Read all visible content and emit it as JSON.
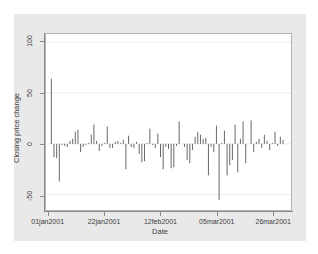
{
  "chart_data": {
    "type": "bar",
    "title": "",
    "subtitle": "",
    "xlabel": "Date",
    "ylabel": "Closing price change",
    "ylim": [
      -65,
      108
    ],
    "yticks": [
      -50,
      0,
      50,
      100
    ],
    "ytick_labels": [
      "-50",
      "0",
      "50",
      "100"
    ],
    "xtick_labels": [
      "01jan2001",
      "22jan2001",
      "12feb2001",
      "05mar2001",
      "26mar2001"
    ],
    "xtick_values": [
      0,
      21,
      42,
      63,
      84
    ],
    "xlim": [
      -1,
      91
    ],
    "grid": "horizontal",
    "legend": "none",
    "style": "spike",
    "series_name": "Closing price change",
    "x": [
      1,
      2,
      3,
      4,
      5,
      6,
      7,
      8,
      9,
      10,
      11,
      12,
      13,
      14,
      15,
      16,
      17,
      18,
      19,
      20,
      21,
      22,
      23,
      24,
      25,
      26,
      27,
      28,
      29,
      30,
      31,
      32,
      33,
      34,
      35,
      36,
      37,
      38,
      39,
      40,
      41,
      42,
      43,
      44,
      45,
      46,
      47,
      48,
      49,
      50,
      51,
      52,
      53,
      54,
      55,
      56,
      57,
      58,
      59,
      60,
      61,
      62,
      63,
      64,
      65,
      66,
      67,
      68,
      69,
      70,
      71,
      72,
      73,
      74,
      75,
      76,
      77,
      78,
      79,
      80,
      81,
      82,
      83,
      84,
      85,
      86,
      87,
      88
    ],
    "values": [
      64,
      -13,
      -14,
      -37,
      -1,
      -2,
      -3,
      3,
      5,
      12,
      14,
      -8,
      -3,
      -1,
      1,
      9,
      19,
      3,
      -7,
      -2,
      1,
      17,
      -4,
      -4,
      2,
      3,
      1,
      4,
      -25,
      8,
      -3,
      -4,
      2,
      -10,
      -18,
      -17,
      1,
      15,
      -1,
      -4,
      10,
      -13,
      -25,
      -3,
      -5,
      -24,
      -23,
      -2,
      22,
      0,
      -3,
      -16,
      -19,
      -6,
      7,
      12,
      9,
      5,
      6,
      -31,
      -3,
      -8,
      18,
      -55,
      1,
      13,
      -31,
      -21,
      -16,
      19,
      -28,
      5,
      22,
      -19,
      0,
      23,
      -8,
      2,
      5,
      -4,
      9,
      3,
      -6,
      1,
      12,
      -2,
      7,
      4
    ],
    "bar_color": "#555555",
    "zero_line": 0
  },
  "figure": {
    "background": "#e9e9e9",
    "plot_background": "#ffffff",
    "axis_color": "#8c8c8c",
    "grid_color": "#ebebeb",
    "text_color": "#3c3c3c"
  }
}
